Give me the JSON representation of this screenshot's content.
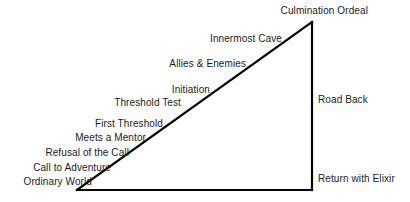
{
  "diagram": {
    "type": "hero-journey-triangle",
    "background_color": "#ffffff",
    "line_color": "#000000",
    "text_color": "#1a1a1a",
    "shape": {
      "name": "right-triangle",
      "apex": [
        312,
        22
      ],
      "bottom_left": [
        77,
        190
      ],
      "bottom_right": [
        312,
        190
      ],
      "stroke_width": 2
    },
    "stages": [
      {
        "label": "Culmination Ordeal",
        "x": 368,
        "y": 5,
        "align": "right"
      },
      {
        "label": "Innermost Cave",
        "x": 282,
        "y": 33,
        "align": "right"
      },
      {
        "label": "Allies & Enemies",
        "x": 246,
        "y": 58,
        "align": "right"
      },
      {
        "label": "Initiation",
        "x": 210,
        "y": 84,
        "align": "right"
      },
      {
        "label": "Threshold Test",
        "x": 181,
        "y": 97,
        "align": "right"
      },
      {
        "label": "First Threshold",
        "x": 163,
        "y": 118,
        "align": "right"
      },
      {
        "label": "Meets a Mentor",
        "x": 146,
        "y": 132,
        "align": "right"
      },
      {
        "label": "Refusal of the Call",
        "x": 129,
        "y": 147,
        "align": "right"
      },
      {
        "label": "Call to Adventure",
        "x": 111,
        "y": 162,
        "align": "right"
      },
      {
        "label": "Ordinary World",
        "x": 92,
        "y": 176,
        "align": "right"
      },
      {
        "label": "Road Back",
        "x": 318,
        "y": 94,
        "align": "left"
      },
      {
        "label": "Return with Elixir",
        "x": 318,
        "y": 173,
        "align": "left"
      }
    ]
  }
}
